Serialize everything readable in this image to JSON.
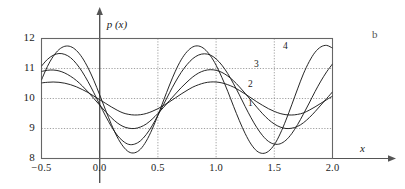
{
  "panel": {
    "tag": "b"
  },
  "axes": {
    "y_axis_name": "p (x)",
    "x_axis_name": "x",
    "y_ticks": [
      "12",
      "11",
      "10",
      "9",
      "8"
    ],
    "x_ticks": [
      "−0.5",
      "0.0",
      "0.5",
      "1.0",
      "1.5",
      "2.0"
    ]
  },
  "curve_labels": [
    "1",
    "2",
    "3",
    "4"
  ],
  "colors": {
    "curve": "#1a1a1a",
    "frame": "#666666",
    "grid": "#888888",
    "axis": "#555555",
    "text": "#1a1a1a"
  },
  "chart_data": {
    "type": "line",
    "title": "",
    "xlabel": "x",
    "ylabel": "p (x)",
    "xlim": [
      -0.5,
      2.0
    ],
    "ylim": [
      8,
      12
    ],
    "xticks": [
      -0.5,
      0.0,
      0.5,
      1.0,
      1.5,
      2.0
    ],
    "yticks": [
      8,
      9,
      10,
      11,
      12
    ],
    "grid": true,
    "legend": "inline-curve-labels",
    "x": [
      -0.5,
      -0.45,
      -0.4,
      -0.35,
      -0.3,
      -0.25,
      -0.2,
      -0.15,
      -0.1,
      -0.05,
      0.0,
      0.05,
      0.1,
      0.15,
      0.2,
      0.25,
      0.3,
      0.35,
      0.4,
      0.45,
      0.5,
      0.55,
      0.6,
      0.65,
      0.7,
      0.75,
      0.8,
      0.85,
      0.9,
      0.95,
      1.0,
      1.05,
      1.1,
      1.15,
      1.2,
      1.25,
      1.3,
      1.35,
      1.4,
      1.45,
      1.5,
      1.55,
      1.6,
      1.65,
      1.7,
      1.75,
      1.8,
      1.85,
      1.9,
      1.95,
      2.0
    ],
    "series": [
      {
        "name": "1",
        "label": "1",
        "mean": 10.0,
        "amplitude": 0.55,
        "period": 1.0,
        "phase_deg": 70,
        "values": [
          10.52,
          10.54,
          10.55,
          10.54,
          10.51,
          10.46,
          10.39,
          10.3,
          10.2,
          10.08,
          9.96,
          9.84,
          9.72,
          9.61,
          9.52,
          9.47,
          9.45,
          9.46,
          9.5,
          9.57,
          9.66,
          9.77,
          9.89,
          10.02,
          10.15,
          10.27,
          10.38,
          10.46,
          10.52,
          10.55,
          10.55,
          10.52,
          10.46,
          10.38,
          10.27,
          10.15,
          10.02,
          9.89,
          9.77,
          9.66,
          9.57,
          9.5,
          9.46,
          9.45,
          9.47,
          9.52,
          9.61,
          9.72,
          9.84,
          9.96,
          10.08
        ]
      },
      {
        "name": "2",
        "label": "2",
        "mean": 10.0,
        "amplitude": 0.95,
        "period": 1.0,
        "phase_deg": 85,
        "values": [
          10.9,
          10.94,
          10.95,
          10.92,
          10.85,
          10.74,
          10.6,
          10.42,
          10.22,
          10.0,
          9.78,
          9.56,
          9.36,
          9.19,
          9.07,
          9.01,
          9.0,
          9.05,
          9.15,
          9.31,
          9.5,
          9.71,
          9.93,
          10.15,
          10.36,
          10.55,
          10.72,
          10.85,
          10.93,
          10.96,
          10.94,
          10.87,
          10.75,
          10.59,
          10.39,
          10.17,
          9.94,
          9.71,
          9.49,
          9.3,
          9.15,
          9.05,
          9.0,
          9.01,
          9.07,
          9.19,
          9.36,
          9.56,
          9.78,
          10.0,
          10.22
        ]
      },
      {
        "name": "3",
        "label": "3",
        "mean": 10.0,
        "amplitude": 1.45,
        "period": 1.0,
        "phase_deg": 100,
        "values": [
          11.08,
          11.3,
          11.44,
          11.5,
          11.47,
          11.36,
          11.16,
          10.89,
          10.56,
          10.19,
          9.8,
          9.42,
          9.07,
          8.78,
          8.58,
          8.47,
          8.48,
          8.59,
          8.8,
          9.09,
          9.44,
          9.81,
          10.19,
          10.55,
          10.87,
          11.13,
          11.33,
          11.45,
          11.49,
          11.45,
          11.32,
          11.11,
          10.83,
          10.49,
          10.12,
          9.73,
          9.36,
          9.03,
          8.76,
          8.57,
          8.48,
          8.49,
          8.61,
          8.83,
          9.13,
          9.48,
          9.85,
          10.23,
          10.58,
          10.89,
          11.15
        ]
      },
      {
        "name": "4",
        "label": "4",
        "mean": 10.0,
        "amplitude": 1.78,
        "period": 1.0,
        "phase_deg": 128,
        "values": [
          10.62,
          11.06,
          11.4,
          11.63,
          11.74,
          11.73,
          11.6,
          11.36,
          11.02,
          10.6,
          10.12,
          9.62,
          9.14,
          8.72,
          8.41,
          8.22,
          8.19,
          8.31,
          8.58,
          8.97,
          9.44,
          9.95,
          10.45,
          10.91,
          11.29,
          11.56,
          11.72,
          11.75,
          11.65,
          11.43,
          11.11,
          10.7,
          10.24,
          9.74,
          9.26,
          8.83,
          8.48,
          8.25,
          8.17,
          8.24,
          8.46,
          8.82,
          9.28,
          9.79,
          10.32,
          10.82,
          11.23,
          11.54,
          11.72,
          11.77,
          11.68
        ]
      }
    ]
  }
}
